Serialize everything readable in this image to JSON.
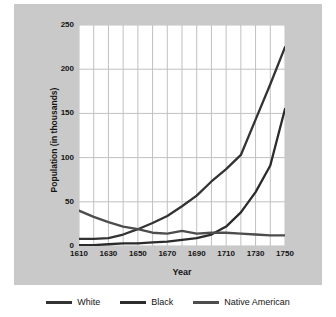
{
  "chart_data": {
    "type": "line",
    "title": "",
    "xlabel": "Year",
    "ylabel": "Population (in thousands)",
    "xlim": [
      1610,
      1750
    ],
    "ylim": [
      0,
      250
    ],
    "xticks": [
      1610,
      1630,
      1650,
      1670,
      1690,
      1710,
      1730,
      1750
    ],
    "xtick_labels": [
      "1610",
      "1630",
      "1650",
      "1670",
      "1690",
      "1710",
      "1730",
      "1750"
    ],
    "yticks": [
      0,
      50,
      100,
      150,
      200,
      250
    ],
    "ytick_labels": [
      "0",
      "50",
      "100",
      "150",
      "200",
      "250"
    ],
    "grid": true,
    "grid_x_step": 10,
    "legend_position": "bottom",
    "x": [
      1610,
      1620,
      1630,
      1640,
      1650,
      1660,
      1670,
      1680,
      1690,
      1700,
      1710,
      1720,
      1730,
      1740,
      1750
    ],
    "series": [
      {
        "name": "White",
        "color": "#333333",
        "values": [
          8,
          8,
          9,
          13,
          19,
          26,
          34,
          45,
          57,
          73,
          87,
          103,
          143,
          183,
          225
        ]
      },
      {
        "name": "Black",
        "color": "#2b2b2b",
        "values": [
          1,
          1,
          2,
          3,
          3,
          4,
          5,
          7,
          9,
          13,
          22,
          38,
          61,
          91,
          155
        ]
      },
      {
        "name": "Native American",
        "color": "#4d4d4d",
        "values": [
          40,
          33,
          27,
          22,
          19,
          15,
          14,
          17,
          14,
          15,
          15,
          14,
          13,
          12,
          12
        ]
      }
    ]
  },
  "legend": {
    "items": [
      {
        "label": "White",
        "swatch": "line-swatch-white-series"
      },
      {
        "label": "Black",
        "swatch": "line-swatch-black-series"
      },
      {
        "label": "Native American",
        "swatch": "line-swatch-native-american-series"
      }
    ]
  },
  "colors": {
    "panel_background": "#c9c9c9",
    "plot_background": "#ffffff",
    "grid": "#c0c0c0",
    "text": "#141414"
  }
}
